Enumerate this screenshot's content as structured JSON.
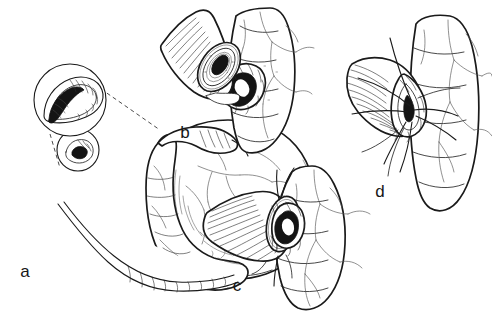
{
  "figure": {
    "background_color": "#ffffff",
    "ink_color": "#1a1a1a",
    "vessel_color": "#555555",
    "lumen_color": "#141414",
    "width": 492,
    "height": 312
  },
  "panels": [
    {
      "id": "a",
      "label": "a",
      "label_x": 25,
      "label_y": 277,
      "caption": "Mobilized conduit with hollow viscus; circular inset magnifies the orifice",
      "features": [
        "large-hollow-viscus",
        "tubular-conduit",
        "distal-limb",
        "magnified-inset-circle",
        "orifice-circle",
        "dashed-leader-lines",
        "serosal-vessels"
      ]
    },
    {
      "id": "b",
      "label": "b",
      "label_x": 185,
      "label_y": 138,
      "caption": "Open conduit end approximated to the prepared opening in the viscus wall",
      "features": [
        "ribbed-conduit-tube",
        "conduit-lumen",
        "tissue-opening",
        "opening-lumen",
        "viscus-wall",
        "serosal-vessels"
      ]
    },
    {
      "id": "c",
      "label": "c",
      "label_x": 237,
      "label_y": 291,
      "caption": "Conduit end seated against the opening and secured with anchoring sutures",
      "features": [
        "ribbed-conduit-tube",
        "tissue-opening",
        "anchoring-suture",
        "viscus-wall",
        "serosal-vessels"
      ]
    },
    {
      "id": "d",
      "label": "d",
      "label_x": 380,
      "label_y": 197,
      "caption": "Completed anastomosis with interrupted sutures placed and left untied",
      "features": [
        "ribbed-conduit-tube",
        "completed-anastomosis",
        "suture-threads",
        "viscus-wall",
        "serosal-vessels"
      ]
    }
  ],
  "inset": {
    "magnified_circle": {
      "cx": 70,
      "cy": 100,
      "r": 36
    },
    "source_circle": {
      "cx": 78,
      "cy": 150,
      "r": 21
    },
    "leader_style": "dashed"
  }
}
